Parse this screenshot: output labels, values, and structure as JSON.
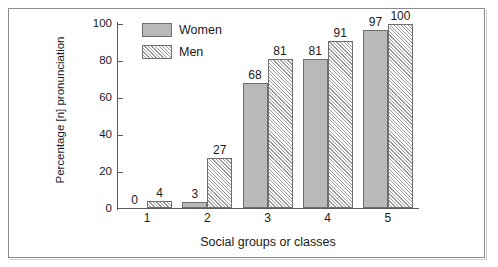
{
  "chart_data": {
    "type": "bar",
    "title": "",
    "xlabel": "Social groups or classes",
    "ylabel": "Percentage [n] pronunciation",
    "categories": [
      "1",
      "2",
      "3",
      "4",
      "5"
    ],
    "series": [
      {
        "name": "Women",
        "values": [
          0,
          3,
          68,
          81,
          97
        ]
      },
      {
        "name": "Men",
        "values": [
          4,
          27,
          81,
          91,
          100
        ]
      }
    ],
    "ylim": [
      0,
      100
    ],
    "yticks": [
      0,
      20,
      40,
      60,
      80,
      100
    ],
    "grid": false,
    "legend_position": "top-left-inside",
    "colors": {
      "women_fill": "#b9b9b9",
      "men_fill": "#ffffff",
      "men_hatch": "#9a9a9a",
      "bar_edge": "#6e6e6e",
      "axis": "#5a5a5a",
      "frame": "#8c8c8c",
      "text": "#1a1a1a"
    }
  },
  "legend": {
    "items": [
      {
        "label": "Women",
        "style": "solid"
      },
      {
        "label": "Men",
        "style": "hatched"
      }
    ]
  },
  "axes": {
    "y_tick_labels": [
      "100",
      "80",
      "60",
      "40",
      "20",
      "0"
    ],
    "x_tick_labels": [
      "1",
      "2",
      "3",
      "4",
      "5"
    ],
    "y_title": "Percentage [n] pronunciation",
    "x_title": "Social groups or classes"
  },
  "bar_labels": {
    "group1": {
      "women": "0",
      "men": "4"
    },
    "group2": {
      "women": "3",
      "men": "27"
    },
    "group3": {
      "women": "68",
      "men": "81"
    },
    "group4": {
      "women": "81",
      "men": "91"
    },
    "group5": {
      "women": "97",
      "men": "100"
    }
  }
}
